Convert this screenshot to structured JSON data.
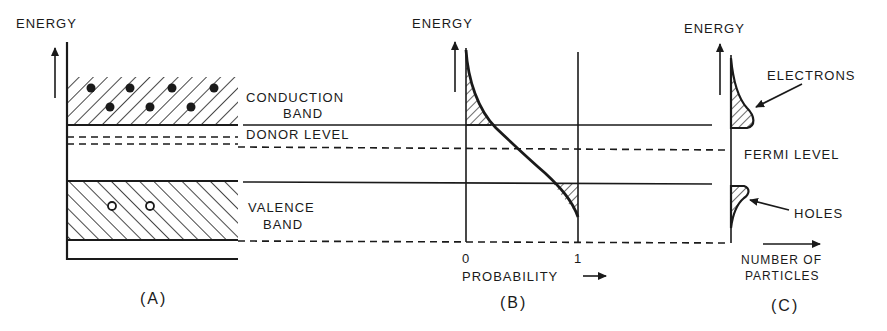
{
  "figure": {
    "panels": [
      {
        "id": "A",
        "caption": "(A)",
        "axis_label": "ENERGY",
        "labels": {
          "conduction_line1": "CONDUCTION",
          "conduction_line2": "BAND",
          "donor": "DONOR LEVEL",
          "valence_line1": "VALENCE",
          "valence_line2": "BAND"
        },
        "electrons_count": 7,
        "holes_count": 2
      },
      {
        "id": "B",
        "caption": "(B)",
        "axis_label": "ENERGY",
        "x_axis_label": "PROBABILITY",
        "x_ticks": [
          "0",
          "1"
        ]
      },
      {
        "id": "C",
        "caption": "(C)",
        "axis_label": "ENERGY",
        "labels": {
          "electrons": "ELECTRONS",
          "fermi": "FERMI LEVEL",
          "holes": "HOLES",
          "x_axis_line1": "NUMBER OF",
          "x_axis_line2": "PARTICLES"
        }
      }
    ],
    "colors": {
      "ink": "#1a1a1a",
      "background": "#ffffff"
    }
  }
}
